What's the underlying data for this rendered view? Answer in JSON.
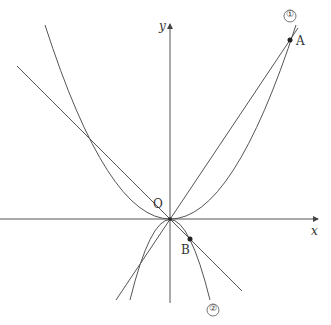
{
  "labels": {
    "y_axis": "y",
    "x_axis": "x",
    "origin": "O",
    "point_a": "A",
    "point_b": "B",
    "curve1": "①",
    "curve2": "②"
  },
  "colors": {
    "stroke": "#555555",
    "background": "#ffffff"
  }
}
